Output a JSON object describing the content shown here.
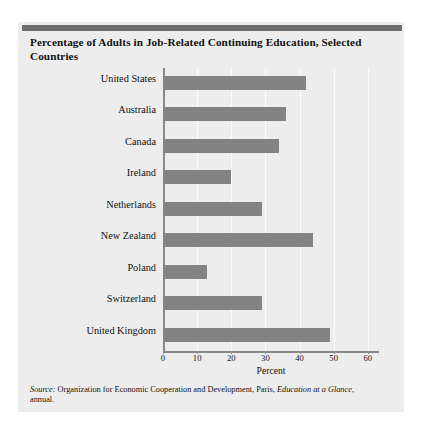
{
  "title": "Percentage of Adults in Job-Related Continuing Education, Selected Countries",
  "source": {
    "prefix": "Source:",
    "text_1": " Organization for Economic Cooperation and Development, Paris, ",
    "italic_2": "Education at a Glance",
    "text_3": ", annual."
  },
  "colors": {
    "bar": "#838383",
    "panel": "#ededed",
    "rule": "#6d6d6d",
    "axis": "#8a8a8a",
    "grid": "#fbfbfb",
    "text": "#111111"
  },
  "chart_data": {
    "type": "bar",
    "orientation": "horizontal",
    "title": "Percentage of Adults in Job-Related Continuing Education, Selected Countries",
    "xlabel": "Percent",
    "ylabel": "",
    "xlim": [
      0,
      63
    ],
    "xticks": [
      0,
      10,
      20,
      30,
      40,
      50,
      60
    ],
    "xticklabels": [
      "0",
      "10",
      "20",
      "30",
      "40",
      "50",
      "60"
    ],
    "grid": true,
    "legend": false,
    "categories": [
      "United States",
      "Australia",
      "Canada",
      "Ireland",
      "Netherlands",
      "New Zealand",
      "Poland",
      "Switzerland",
      "United Kingdom"
    ],
    "values": [
      42,
      36,
      34,
      20,
      29,
      44,
      13,
      29,
      49
    ]
  }
}
